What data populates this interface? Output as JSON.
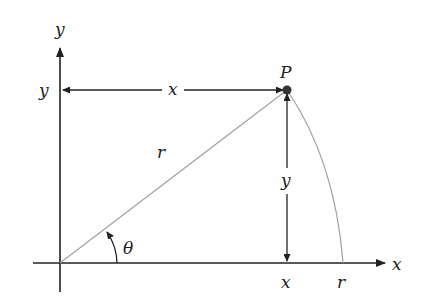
{
  "diagram": {
    "labels": {
      "y_axis": "y",
      "x_axis": "x",
      "point": "P",
      "horizontal_segment": "x",
      "vertical_segment": "y",
      "y_tick": "y",
      "x_tick": "x",
      "r_tick": "r",
      "radius": "r",
      "angle": "θ"
    },
    "colors": {
      "axes": "#222222",
      "radius_line": "#a0a0a0",
      "arc": "#a0a0a0",
      "point": "#333333"
    }
  }
}
